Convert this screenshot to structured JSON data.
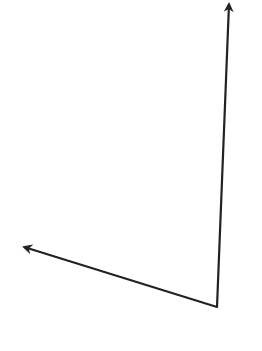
{
  "diagram": {
    "type": "angle-rays",
    "background": "#ffffff",
    "stroke_color": "#222222",
    "stroke_width": 2.2,
    "vertex": {
      "x": 217,
      "y": 307
    },
    "rays": [
      {
        "name": "ray-up",
        "from": {
          "x": 217,
          "y": 307
        },
        "to": {
          "x": 229,
          "y": 4
        }
      },
      {
        "name": "ray-left",
        "from": {
          "x": 217,
          "y": 307
        },
        "to": {
          "x": 24,
          "y": 247
        }
      }
    ]
  }
}
